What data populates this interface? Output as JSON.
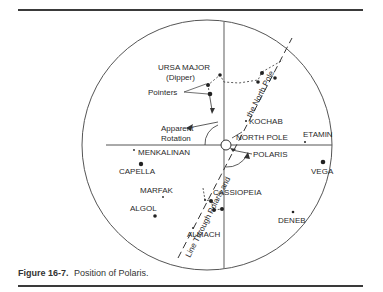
{
  "figure": {
    "number_label": "Figure 16-7.",
    "caption": "Position of Polaris."
  },
  "diagram": {
    "center": [
      207,
      145
    ],
    "radius": 125,
    "line_label_lower": "Line Through Polaris and",
    "line_label_upper": "the North Pole",
    "labels": {
      "ursa_major": "URSA MAJOR",
      "dipper": "(Dipper)",
      "pointers": "Pointers",
      "apparent": "Apparent",
      "rotation": "Rotation",
      "kochab": "KOCHAB",
      "north_pole": "NORTH POLE",
      "etamin": "ETAMIN",
      "polaris": "POLARIS",
      "vega": "VEGA",
      "menkalinan": "MENKALINAN",
      "capella": "CAPELLA",
      "marfak": "MARFAK",
      "cassiopeia": "CASSIOPEIA",
      "algol": "ALGOL",
      "deneb": "DENEB",
      "almach": "ALMACH"
    },
    "colors": {
      "ink": "#2a2a2a",
      "axis": "#555555",
      "background": "#ffffff"
    }
  }
}
